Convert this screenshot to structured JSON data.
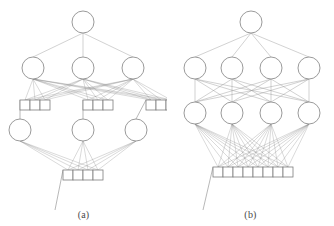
{
  "figure": {
    "kind": "neural-network-architecture-diagram",
    "background_color": "#ffffff",
    "stroke_color": "#8e8e8e",
    "caption_color": "#4a4a4a"
  },
  "panels": [
    {
      "id": "a",
      "caption": "(a)",
      "description": "Hierarchical modular network with grouped input blocks",
      "layers": [
        {
          "name": "top-output-node",
          "type": "circle",
          "count": 1,
          "cx": [
            83
          ],
          "cy": 22,
          "r": 11
        },
        {
          "name": "upper-hidden-row",
          "type": "circle",
          "count": 3,
          "cx": [
            33,
            83,
            133
          ],
          "cy": 68,
          "r": 11
        },
        {
          "name": "upper-input-boxes",
          "type": "box",
          "count": 9,
          "groups": 3,
          "per_group": 3,
          "cy": 105,
          "w": 10,
          "h": 10,
          "group_x": [
            20,
            83,
            146
          ]
        },
        {
          "name": "lower-hidden-row",
          "type": "circle",
          "count": 3,
          "cx": [
            20,
            83,
            136
          ],
          "cy": 130,
          "r": 11
        },
        {
          "name": "lower-input-boxes",
          "type": "box",
          "count": 4,
          "cy": 175,
          "w": 10,
          "h": 10,
          "center_x": 83
        }
      ],
      "connection_style": "block-local sparse fan"
    },
    {
      "id": "b",
      "caption": "(b)",
      "description": "Fully connected multilayer network with single flat input vector",
      "layers": [
        {
          "name": "top-output-node",
          "type": "circle",
          "count": 1,
          "cx": [
            84
          ],
          "cy": 22,
          "r": 11
        },
        {
          "name": "upper-hidden-row",
          "type": "circle",
          "count": 4,
          "cx": [
            28,
            65,
            104,
            142
          ],
          "cy": 68,
          "r": 11
        },
        {
          "name": "lower-hidden-row",
          "type": "circle",
          "count": 4,
          "cx": [
            28,
            65,
            104,
            142
          ],
          "cy": 113,
          "r": 11
        },
        {
          "name": "flat-input-boxes",
          "type": "box",
          "count": 8,
          "cy": 172,
          "w": 10,
          "h": 10,
          "center_x": 86
        }
      ],
      "connection_style": "fully connected dense"
    }
  ]
}
